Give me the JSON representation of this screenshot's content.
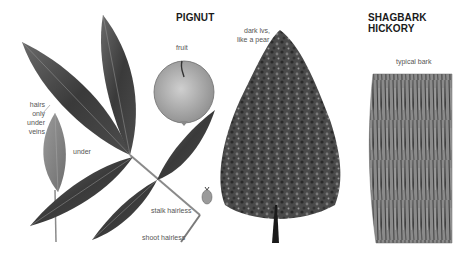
{
  "titles": {
    "left": "PIGNUT",
    "right": "SHAGBARK HICKORY"
  },
  "labels": {
    "fruit": "fruit",
    "hairs_line1": "hairs",
    "hairs_line2": "only",
    "hairs_line3": "under",
    "hairs_line4": "veins",
    "under": "under",
    "stalk": "stalk hairless",
    "shoot": "shoot hairless",
    "tree_line1": "dark lvs,",
    "tree_line2": "like a pear",
    "bark": "typical bark"
  },
  "colors": {
    "background": "#ffffff",
    "leaf_dark": "#3a3a3a",
    "leaf_mid": "#5e5e5e",
    "leaf_light": "#8a8a8a",
    "fruit": "#b4b4b4",
    "bark": "#7a7a7a",
    "text": "#555555",
    "title": "#1a1a1a"
  },
  "icons": {
    "compound_leaf": "pignut-compound-leaf-illustration",
    "fruit": "pignut-fruit-illustration",
    "tree": "pignut-tree-illustration",
    "bark": "shagbark-bark-illustration"
  }
}
